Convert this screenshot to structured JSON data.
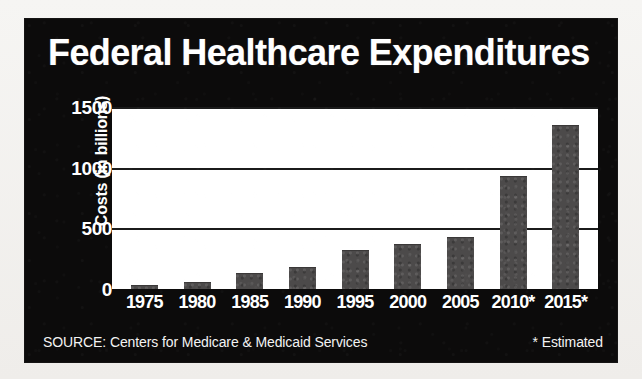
{
  "chart_data": {
    "type": "bar",
    "title": "Federal Healthcare Expenditures",
    "xlabel": "",
    "ylabel": "Costs (in billions)",
    "categories": [
      "1975",
      "1980",
      "1985",
      "1990",
      "1995",
      "2000",
      "2005",
      "2010*",
      "2015*"
    ],
    "values": [
      25,
      50,
      120,
      175,
      310,
      360,
      420,
      925,
      1345
    ],
    "ylim": [
      0,
      1500
    ],
    "yticks": [
      1500,
      1000,
      500,
      0
    ],
    "ytick_labels": [
      "1500",
      "1000",
      "500",
      "0"
    ],
    "grid": true,
    "gridlines_at": [
      500,
      1000,
      1500
    ],
    "legend": null,
    "legend_position": "none",
    "annotations": [
      "SOURCE: Centers for Medicare & Medicaid Services",
      "* Estimated"
    ],
    "bar_color": "#4c4a4a",
    "plot_background": "#ffffff",
    "panel_background": "#0c0b0b",
    "text_color": "#ffffff"
  },
  "footer": {
    "source": "SOURCE: Centers for Medicare & Medicaid Services",
    "estimated": "* Estimated"
  }
}
